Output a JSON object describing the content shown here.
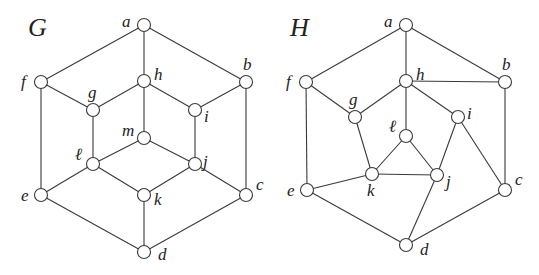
{
  "graphs": [
    {
      "name": "G",
      "title_pos": [
        28,
        36
      ],
      "vertices": [
        {
          "id": "a",
          "label": "a",
          "x": 144,
          "y": 25,
          "lx": -22,
          "ly": 2
        },
        {
          "id": "f",
          "label": "f",
          "x": 41,
          "y": 82,
          "lx": -20,
          "ly": 5
        },
        {
          "id": "h",
          "label": "h",
          "x": 144,
          "y": 81,
          "lx": 10,
          "ly": -1
        },
        {
          "id": "b",
          "label": "b",
          "x": 246,
          "y": 82,
          "lx": -3,
          "ly": -12
        },
        {
          "id": "g",
          "label": "g",
          "x": 93,
          "y": 110,
          "lx": -5,
          "ly": -12
        },
        {
          "id": "i",
          "label": "i",
          "x": 195,
          "y": 110,
          "lx": 9,
          "ly": 12
        },
        {
          "id": "m",
          "label": "m",
          "x": 144,
          "y": 138,
          "lx": -22,
          "ly": -2
        },
        {
          "id": "l",
          "label": "ℓ",
          "x": 93,
          "y": 164,
          "lx": -18,
          "ly": -4
        },
        {
          "id": "j",
          "label": "j",
          "x": 195,
          "y": 164,
          "lx": 8,
          "ly": 3
        },
        {
          "id": "e",
          "label": "e",
          "x": 41,
          "y": 195,
          "lx": -20,
          "ly": 6
        },
        {
          "id": "k",
          "label": "k",
          "x": 144,
          "y": 195,
          "lx": 10,
          "ly": 10
        },
        {
          "id": "c",
          "label": "c",
          "x": 246,
          "y": 195,
          "lx": 10,
          "ly": -5
        },
        {
          "id": "d",
          "label": "d",
          "x": 144,
          "y": 252,
          "lx": 14,
          "ly": 8
        }
      ],
      "edges": [
        [
          "a",
          "f"
        ],
        [
          "a",
          "h"
        ],
        [
          "a",
          "b"
        ],
        [
          "f",
          "g"
        ],
        [
          "g",
          "h"
        ],
        [
          "h",
          "i"
        ],
        [
          "i",
          "b"
        ],
        [
          "h",
          "m"
        ],
        [
          "f",
          "e"
        ],
        [
          "g",
          "l"
        ],
        [
          "i",
          "j"
        ],
        [
          "b",
          "c"
        ],
        [
          "m",
          "l"
        ],
        [
          "m",
          "j"
        ],
        [
          "l",
          "e"
        ],
        [
          "l",
          "k"
        ],
        [
          "j",
          "k"
        ],
        [
          "j",
          "c"
        ],
        [
          "e",
          "d"
        ],
        [
          "k",
          "d"
        ],
        [
          "c",
          "d"
        ]
      ]
    },
    {
      "name": "H",
      "title_pos": [
        290,
        36
      ],
      "vertices": [
        {
          "id": "a",
          "label": "a",
          "x": 406,
          "y": 25,
          "lx": -22,
          "ly": 2
        },
        {
          "id": "f",
          "label": "f",
          "x": 306,
          "y": 82,
          "lx": -20,
          "ly": 5
        },
        {
          "id": "h",
          "label": "h",
          "x": 406,
          "y": 81,
          "lx": 10,
          "ly": -1
        },
        {
          "id": "b",
          "label": "b",
          "x": 505,
          "y": 82,
          "lx": -3,
          "ly": -12
        },
        {
          "id": "g",
          "label": "g",
          "x": 355,
          "y": 117,
          "lx": -6,
          "ly": -12
        },
        {
          "id": "i",
          "label": "i",
          "x": 458,
          "y": 117,
          "lx": 9,
          "ly": 2
        },
        {
          "id": "l",
          "label": "ℓ",
          "x": 406,
          "y": 136,
          "lx": -17,
          "ly": -4
        },
        {
          "id": "k",
          "label": "k",
          "x": 372,
          "y": 174,
          "lx": -5,
          "ly": 22
        },
        {
          "id": "j",
          "label": "j",
          "x": 437,
          "y": 175,
          "lx": 9,
          "ly": 12
        },
        {
          "id": "e",
          "label": "e",
          "x": 307,
          "y": 190,
          "lx": -20,
          "ly": 6
        },
        {
          "id": "c",
          "label": "c",
          "x": 505,
          "y": 190,
          "lx": 10,
          "ly": -5
        },
        {
          "id": "d",
          "label": "d",
          "x": 406,
          "y": 245,
          "lx": 14,
          "ly": 10
        }
      ],
      "edges": [
        [
          "a",
          "f"
        ],
        [
          "a",
          "h"
        ],
        [
          "a",
          "b"
        ],
        [
          "h",
          "b"
        ],
        [
          "f",
          "g"
        ],
        [
          "g",
          "h"
        ],
        [
          "h",
          "i"
        ],
        [
          "h",
          "l"
        ],
        [
          "f",
          "e"
        ],
        [
          "b",
          "c"
        ],
        [
          "g",
          "k"
        ],
        [
          "l",
          "k"
        ],
        [
          "l",
          "j"
        ],
        [
          "k",
          "j"
        ],
        [
          "i",
          "j"
        ],
        [
          "i",
          "c"
        ],
        [
          "e",
          "k"
        ],
        [
          "e",
          "d"
        ],
        [
          "j",
          "d"
        ],
        [
          "c",
          "d"
        ]
      ]
    }
  ]
}
